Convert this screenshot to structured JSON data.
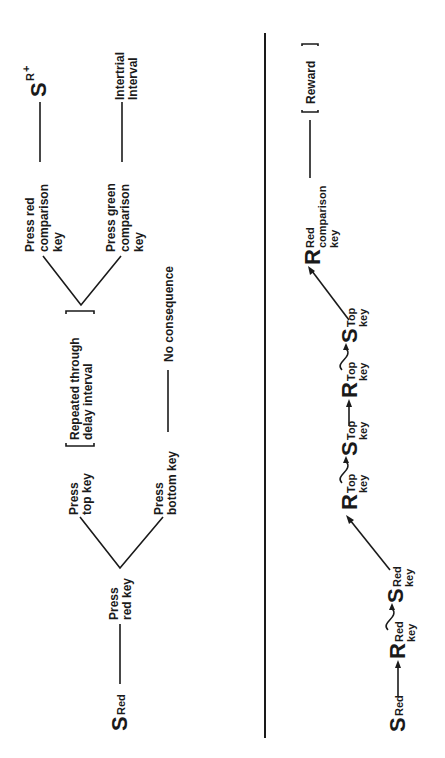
{
  "top_diagram": {
    "start": {
      "symbol": "S",
      "subscript": "Red"
    },
    "step1": [
      "Press",
      "red key"
    ],
    "branch_top": [
      "Press",
      "top key"
    ],
    "branch_bottom": [
      "Press",
      "bottom key"
    ],
    "bottom_outcome": "No consequence",
    "repeat_note": [
      "Repeated through",
      "delay interval"
    ],
    "choice_red": [
      "Press red",
      "comparison",
      "key"
    ],
    "choice_green": [
      "Press green",
      "comparison",
      "key"
    ],
    "red_outcome": {
      "symbol": "S",
      "superscript_base": "R",
      "superscript_sign": "+"
    },
    "green_outcome": [
      "Intertrial",
      "Interval"
    ]
  },
  "bottom_diagram": {
    "chain": [
      {
        "symbol": "S",
        "sub1": "Red",
        "sub2": ""
      },
      {
        "symbol": "R",
        "sub1": "Red",
        "sub2": "key"
      },
      {
        "symbol": "S",
        "sub1": "Red",
        "sub2": "key"
      },
      {
        "symbol": "R",
        "sub1": "Top",
        "sub2": "key"
      },
      {
        "symbol": "S",
        "sub1": "Top",
        "sub2": "key"
      },
      {
        "symbol": "R",
        "sub1": "Top",
        "sub2": "key"
      },
      {
        "symbol": "S",
        "sub1": "Top",
        "sub2": "key"
      },
      {
        "symbol": "R",
        "sub1": "Red",
        "sub2": "comparison",
        "sub3": "key"
      }
    ],
    "reward": "Reward"
  }
}
